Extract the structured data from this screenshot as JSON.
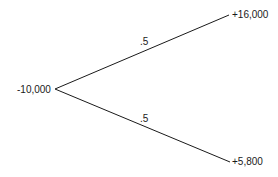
{
  "tree": {
    "root": {
      "label": "-10,000"
    },
    "branches": [
      {
        "probability": ".5",
        "outcome": "+16,000"
      },
      {
        "probability": ".5",
        "outcome": "+5,800"
      }
    ]
  },
  "colors": {
    "line": "#1a1a1a",
    "background": "#ffffff"
  }
}
